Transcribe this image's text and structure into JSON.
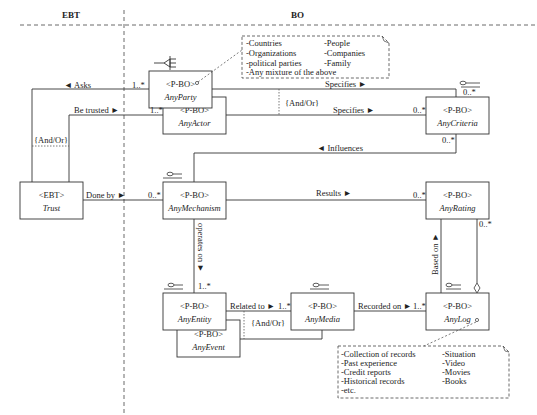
{
  "lanes": {
    "left": "EBT",
    "right": "BO"
  },
  "classes": {
    "trust": {
      "stereotype": "<EBT>",
      "name": "Trust"
    },
    "party": {
      "stereotype": "<P-BO>",
      "name": "AnyParty"
    },
    "actor": {
      "stereotype": "<P-BO>",
      "name": "AnyActor"
    },
    "criteria": {
      "stereotype": "<P-BO>",
      "name": "AnyCriteria"
    },
    "mechanism": {
      "stereotype": "<P-BO>",
      "name": "AnyMechanism"
    },
    "rating": {
      "stereotype": "<P-BO>",
      "name": "AnyRating"
    },
    "entity": {
      "stereotype": "<P-BO>",
      "name": "AnyEntity"
    },
    "event": {
      "stereotype": "<P-BO>",
      "name": "AnyEvent"
    },
    "media": {
      "stereotype": "<P-BO>",
      "name": "AnyMedia"
    },
    "log": {
      "stereotype": "<P-BO>",
      "name": "AnyLog"
    }
  },
  "associations": {
    "asks": "◄ Asks",
    "be_trusted": "Be trusted ►",
    "and_or_left": "{And/Or}",
    "done_by": "Done by ►",
    "specifies_top": "Specifies ►",
    "specifies_mid": "Specifies ►",
    "and_or_top": "{And/Or}",
    "influences": "◄ Influences",
    "results": "Results ►",
    "operates_on": "operates on ►",
    "related_to": "Related to ►",
    "and_or_bottom": "{And/Or}",
    "recorded_on": "Recorded on ►",
    "based_on": "Based on ►"
  },
  "multiplicities": {
    "party_asks": "1..*",
    "actor_trusted": "1..*",
    "mechanism_done_by": "0..*",
    "criteria_top": "0..*",
    "criteria_left": "0..*",
    "criteria_bottom": "0..*",
    "rating_left": "0..*",
    "rating_right": "0..*",
    "entity_top": "1..*",
    "media_left": "1..*",
    "log_left": "1..*"
  },
  "notes": {
    "party_note": {
      "col1": [
        "-Countries",
        "-Organizations",
        "-political parties",
        "-Any mixture of the above"
      ],
      "col2": [
        "-People",
        "-Companies",
        "-Family"
      ]
    },
    "log_note": {
      "col1": [
        "-Collection of records",
        "-Past experience",
        "-Credit reports",
        "-Historical records",
        "-etc."
      ],
      "col2": [
        "-Situation",
        "-Video",
        "-Movies",
        "-Books"
      ]
    }
  }
}
